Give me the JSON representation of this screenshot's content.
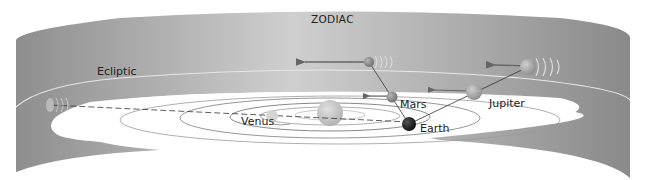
{
  "diagram": {
    "title": "ZODIAC",
    "labels": {
      "zodiac": "ZODIAC",
      "ecliptic": "Ecliptic",
      "venus": "Venus",
      "mars": "Mars",
      "earth": "Earth",
      "jupiter": "Jupiter"
    },
    "colors": {
      "band_light": "#c9c9c9",
      "band_dark": "#8e8e8e",
      "ecliptic_line": "#e6e6e6",
      "plane": "#ffffff",
      "orbit": "#8a8a8a",
      "sun": "#c2c2c2",
      "venus": "#d4d4d4",
      "mars": "#8a8a8a",
      "earth": "#1a1a1a",
      "jupiter": "#a9a9a9",
      "sight_line": "#333333",
      "arrow": "#666666"
    },
    "elements": [
      "zodiac-band",
      "ecliptic-line",
      "orbital-plane",
      "sun",
      "venus-orbit",
      "earth-orbit",
      "mars-orbit",
      "jupiter-orbit",
      "venus",
      "earth",
      "mars",
      "jupiter",
      "mars-projection",
      "jupiter-projection",
      "venus-projection"
    ]
  }
}
